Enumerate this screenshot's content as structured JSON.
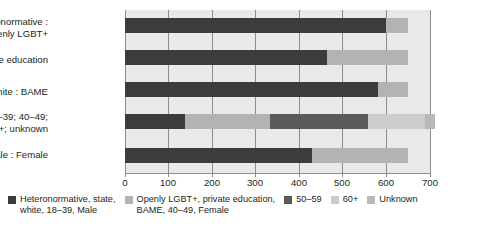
{
  "chart_data": {
    "type": "bar",
    "orientation": "horizontal",
    "stacked": true,
    "title": "",
    "xlabel": "",
    "ylabel": "",
    "xlim": [
      0,
      700
    ],
    "xticks": [
      0,
      100,
      200,
      300,
      400,
      500,
      600,
      700
    ],
    "xtick_labels": [
      "0",
      "100",
      "200",
      "300",
      "400",
      "500",
      "600",
      "700"
    ],
    "grid": true,
    "legend_position": "bottom",
    "categories": [
      "Heteronormative :\nOpenly LGBT+",
      "State : Private education",
      "White : BAME",
      "Age : 18–39; 40–49;\n50–59; 60+; unknown",
      "Male : Female"
    ],
    "series": [
      {
        "name": "Heteronormative, state, white, 18–39, Male",
        "color": "#3c3c3c",
        "values": [
          600,
          464,
          580,
          138,
          430
        ]
      },
      {
        "name": "Openly LGBT+, private education, BAME, 40–49, Female",
        "color": "#b3b3b3",
        "values": [
          50,
          186,
          70,
          195,
          220
        ]
      },
      {
        "name": "50–59",
        "color": "#5a5a5a",
        "values": [
          0,
          0,
          0,
          225,
          0
        ]
      },
      {
        "name": "60+",
        "color": "#cccccc",
        "values": [
          0,
          0,
          0,
          130,
          0
        ]
      },
      {
        "name": "Unknown",
        "color": "#b8b8b8",
        "values": [
          0,
          0,
          0,
          24,
          0
        ]
      }
    ],
    "totals": [
      650,
      650,
      650,
      712,
      650
    ]
  },
  "categories_labels": [
    {
      "line1": "Heteronormative :",
      "line2": "Openly LGBT+"
    },
    {
      "line1": "State : Private education",
      "line2": ""
    },
    {
      "line1": "White : BAME",
      "line2": ""
    },
    {
      "line1": "Age : 18–39; 40–49;",
      "line2": "50–59; 60+; unknown"
    },
    {
      "line1": "Male : Female",
      "line2": ""
    }
  ],
  "legend": {
    "items": [
      {
        "label": "Heteronormative, state,\nwhite, 18–39, Male",
        "color": "#3c3c3c"
      },
      {
        "label": "Openly LGBT+, private education,\nBAME, 40–49, Female",
        "color": "#b3b3b3"
      },
      {
        "label": "50–59",
        "color": "#5a5a5a"
      },
      {
        "label": "60+",
        "color": "#cccccc"
      },
      {
        "label": "Unknown",
        "color": "#b8b8b8"
      }
    ]
  },
  "axis": {
    "tick_labels": [
      "0",
      "100",
      "200",
      "300",
      "400",
      "500",
      "600",
      "700"
    ]
  },
  "colors": {
    "plot_background": "#e9e9e9",
    "gridline": "#8c8c8c",
    "text": "#231f20",
    "page_background": "#ffffff"
  }
}
